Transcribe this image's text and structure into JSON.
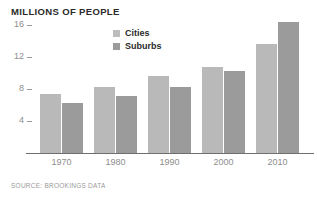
{
  "chart_data": {
    "type": "bar",
    "title": "MILLIONS OF PEOPLE",
    "xlabel": "",
    "ylabel": "",
    "ylim": [
      0,
      17.5
    ],
    "yticks": [
      4,
      8,
      12,
      16
    ],
    "ytick_labels": [
      "4",
      "8",
      "12",
      "16"
    ],
    "grid": false,
    "legend_position": "top-center",
    "categories": [
      "1970",
      "1980",
      "1990",
      "2000",
      "2010"
    ],
    "series": [
      {
        "name": "Cities",
        "color": "#b9b9b9",
        "values": [
          7.4,
          8.3,
          9.6,
          10.7,
          13.6
        ]
      },
      {
        "name": "Suburbs",
        "color": "#9b9b9b",
        "values": [
          6.3,
          7.1,
          8.3,
          10.2,
          16.4
        ]
      }
    ],
    "source": "SOURCE: BROOKINGS DATA"
  },
  "legend": {
    "items": [
      {
        "label": "Cities"
      },
      {
        "label": "Suburbs"
      }
    ]
  },
  "footer": {
    "source": "SOURCE: BROOKINGS DATA"
  }
}
